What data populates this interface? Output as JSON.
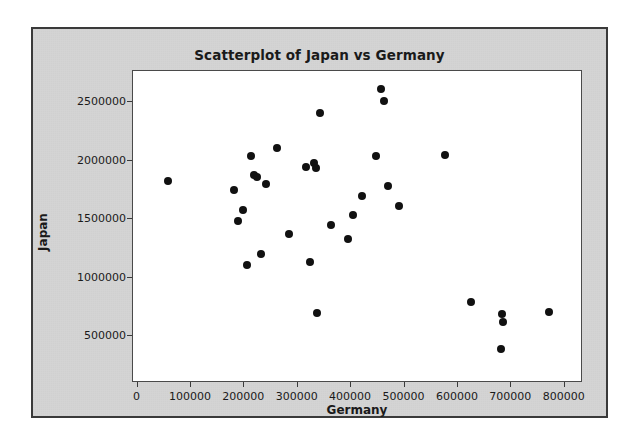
{
  "chart_data": {
    "type": "scatter",
    "title": "Scatterplot of Japan vs Germany",
    "xlabel": "Germany",
    "ylabel": "Japan",
    "xlim": [
      0,
      800000
    ],
    "ylim": [
      250000,
      2750000
    ],
    "grid": false,
    "legend": "none",
    "xticks": [
      "0",
      "100000",
      "200000",
      "300000",
      "400000",
      "500000",
      "600000",
      "700000",
      "800000"
    ],
    "xtick_values": [
      0,
      100000,
      200000,
      300000,
      400000,
      500000,
      600000,
      700000,
      800000
    ],
    "yticks": [
      "500000",
      "1000000",
      "1500000",
      "2000000",
      "2500000"
    ],
    "ytick_values": [
      500000,
      1000000,
      1500000,
      2000000,
      2500000
    ],
    "marker": "filled-circle",
    "marker_color": "#111111",
    "points": [
      {
        "x": 58000,
        "y": 1825000
      },
      {
        "x": 180000,
        "y": 1745000
      },
      {
        "x": 189000,
        "y": 1485000
      },
      {
        "x": 197000,
        "y": 1580000
      },
      {
        "x": 205000,
        "y": 1105000
      },
      {
        "x": 212000,
        "y": 2040000
      },
      {
        "x": 219000,
        "y": 1875000
      },
      {
        "x": 224000,
        "y": 1855000
      },
      {
        "x": 231000,
        "y": 1200000
      },
      {
        "x": 240000,
        "y": 1795000
      },
      {
        "x": 261000,
        "y": 2110000
      },
      {
        "x": 283000,
        "y": 1375000
      },
      {
        "x": 315000,
        "y": 1945000
      },
      {
        "x": 323000,
        "y": 1130000
      },
      {
        "x": 330000,
        "y": 1975000
      },
      {
        "x": 334000,
        "y": 1940000
      },
      {
        "x": 337000,
        "y": 700000
      },
      {
        "x": 342000,
        "y": 2410000
      },
      {
        "x": 362000,
        "y": 1450000
      },
      {
        "x": 395000,
        "y": 1330000
      },
      {
        "x": 403000,
        "y": 1530000
      },
      {
        "x": 420000,
        "y": 1700000
      },
      {
        "x": 447000,
        "y": 2035000
      },
      {
        "x": 456000,
        "y": 2615000
      },
      {
        "x": 462000,
        "y": 2510000
      },
      {
        "x": 470000,
        "y": 1785000
      },
      {
        "x": 490000,
        "y": 1610000
      },
      {
        "x": 575000,
        "y": 2045000
      },
      {
        "x": 625000,
        "y": 790000
      },
      {
        "x": 682000,
        "y": 690000
      },
      {
        "x": 684000,
        "y": 620000
      },
      {
        "x": 680000,
        "y": 385000
      },
      {
        "x": 770000,
        "y": 705000
      }
    ]
  }
}
